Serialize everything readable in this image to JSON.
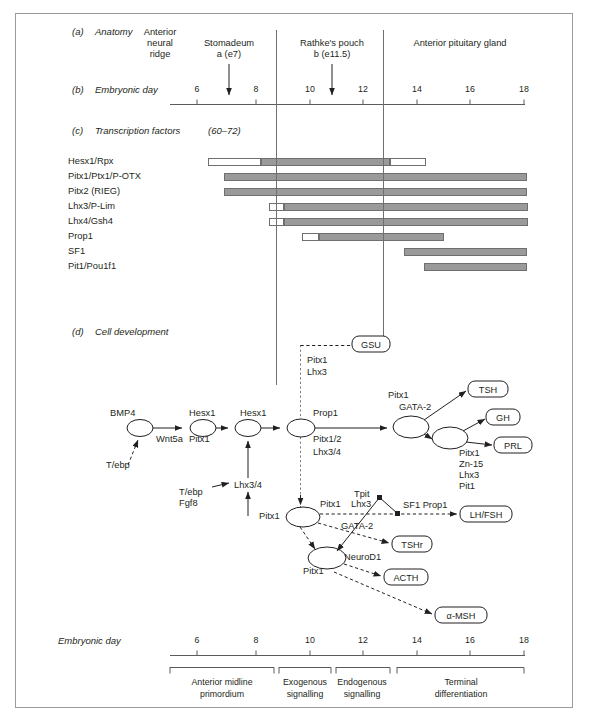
{
  "figure": {
    "sections": {
      "a": {
        "tag": "(a)",
        "title": "Anatomy"
      },
      "b": {
        "tag": "(b)",
        "title": "Embryonic day"
      },
      "c": {
        "tag": "(c)",
        "title": "Transcription factors",
        "refs": "(60–72)"
      },
      "d": {
        "tag": "(d)",
        "title": "Cell development"
      }
    },
    "anatomy": {
      "regions": [
        {
          "name": "anterior-neural-ridge",
          "lines": [
            "Anterior",
            "neural",
            "ridge"
          ]
        },
        {
          "name": "stomadeum",
          "lines": [
            "Stomadeum",
            "a (e7)"
          ]
        },
        {
          "name": "rathkes-pouch",
          "lines": [
            "Rathke's pouch",
            "b (e11.5)"
          ]
        },
        {
          "name": "anterior-pituitary-gland",
          "lines": [
            "Anterior pituitary gland"
          ]
        }
      ]
    },
    "axis": {
      "label": "Embryonic day",
      "ticks": [
        "6",
        "8",
        "10",
        "12",
        "14",
        "16",
        "18"
      ],
      "min": 5,
      "max": 19
    },
    "bottom_axis": {
      "label": "Embryonic day",
      "ticks": [
        "6",
        "8",
        "10",
        "12",
        "14",
        "16",
        "18"
      ]
    },
    "stages": [
      {
        "name": "anterior-midline-primordium",
        "lines": [
          "Anterior midline",
          "primordium"
        ]
      },
      {
        "name": "exogenous-signalling",
        "lines": [
          "Exogenous",
          "signalling"
        ]
      },
      {
        "name": "endogenous-signalling",
        "lines": [
          "Endogenous",
          "signalling"
        ]
      },
      {
        "name": "terminal-differentiation",
        "lines": [
          "Terminal",
          "differentiation"
        ]
      }
    ],
    "transcription_factors": [
      {
        "label": "Hesx1/Rpx",
        "segments": [
          {
            "kind": "w",
            "x1": 208,
            "x2": 261
          },
          {
            "kind": "g",
            "x1": 261,
            "x2": 390
          },
          {
            "kind": "w",
            "x1": 390,
            "x2": 426
          }
        ]
      },
      {
        "label": "Pitx1/Ptx1/P-OTX",
        "segments": [
          {
            "kind": "g",
            "x1": 224,
            "x2": 527
          }
        ]
      },
      {
        "label": "Pitx2 (RIEG)",
        "segments": [
          {
            "kind": "g",
            "x1": 224,
            "x2": 527
          }
        ]
      },
      {
        "label": "Lhx3/P-Lim",
        "segments": [
          {
            "kind": "w",
            "x1": 269,
            "x2": 284
          },
          {
            "kind": "g",
            "x1": 284,
            "x2": 528
          }
        ]
      },
      {
        "label": "Lhx4/Gsh4",
        "segments": [
          {
            "kind": "w",
            "x1": 269,
            "x2": 284
          },
          {
            "kind": "g",
            "x1": 284,
            "x2": 528
          }
        ]
      },
      {
        "label": "Prop1",
        "segments": [
          {
            "kind": "w",
            "x1": 302,
            "x2": 319
          },
          {
            "kind": "g",
            "x1": 319,
            "x2": 444
          }
        ]
      },
      {
        "label": "SF1",
        "segments": [
          {
            "kind": "g",
            "x1": 404,
            "x2": 527
          }
        ]
      },
      {
        "label": "Pit1/Pou1f1",
        "segments": [
          {
            "kind": "g",
            "x1": 424,
            "x2": 527
          }
        ]
      }
    ],
    "pathway": {
      "node_labels": [
        {
          "name": "bmp4",
          "text": "BMP4"
        },
        {
          "name": "wnt5a",
          "text": "Wnt5a"
        },
        {
          "name": "tebp-1",
          "text": "T/ebp"
        },
        {
          "name": "hesx1-a",
          "text": "Hesx1"
        },
        {
          "name": "pitx1-a",
          "text": "Pitx1"
        },
        {
          "name": "hesx1-b",
          "text": "Hesx1"
        },
        {
          "name": "lhx34",
          "text": "Lhx3/4"
        },
        {
          "name": "tebp-2",
          "text": "T/ebp"
        },
        {
          "name": "fgf8",
          "text": "Fgf8"
        },
        {
          "name": "prop1",
          "text": "Prop1"
        },
        {
          "name": "pitx12",
          "text": "Pitx1/2"
        },
        {
          "name": "lhx34-b",
          "text": "Lhx3/4"
        },
        {
          "name": "pitx1-b",
          "text": "Pitx1"
        },
        {
          "name": "gata2-a",
          "text": "GATA-2"
        },
        {
          "name": "pitx1-c",
          "text": "Pitx1"
        },
        {
          "name": "zn15",
          "text": "Zn-15"
        },
        {
          "name": "lhx3-c",
          "text": "Lhx3"
        },
        {
          "name": "pit1-c",
          "text": "Pit1"
        },
        {
          "name": "pitx1-d",
          "text": "Pitx1"
        },
        {
          "name": "pcg",
          "text": "PCG"
        },
        {
          "name": "pitx1-e",
          "text": "Pitx1"
        },
        {
          "name": "lhx3-e",
          "text": "Lhx3"
        },
        {
          "name": "gata2-b",
          "text": "GATA-2"
        },
        {
          "name": "tpit",
          "text": "Tpit"
        },
        {
          "name": "sf1prop1",
          "text": "SF1 Prop1"
        },
        {
          "name": "neurod1",
          "text": "NeuroD1"
        },
        {
          "name": "pitx1-f",
          "text": "Pitx1"
        },
        {
          "name": "pitx1-g",
          "text": "Pitx1"
        },
        {
          "name": "lhx3-g",
          "text": "Lhx3"
        }
      ],
      "outputs": [
        {
          "name": "gsu",
          "text": "GSU"
        },
        {
          "name": "tsh",
          "text": "TSH"
        },
        {
          "name": "gh",
          "text": "GH"
        },
        {
          "name": "prl",
          "text": "PRL"
        },
        {
          "name": "lhfsh",
          "text": "LH/FSH"
        },
        {
          "name": "tshr",
          "text": "TSHr"
        },
        {
          "name": "acth",
          "text": "ACTH"
        },
        {
          "name": "amsh",
          "text": "α-MSH"
        }
      ]
    },
    "colors": {
      "bar_fill": "#9a9a9a",
      "bar_stroke": "#6f6f6f",
      "ink": "#231f20",
      "rule": "#9b9b9b"
    }
  }
}
